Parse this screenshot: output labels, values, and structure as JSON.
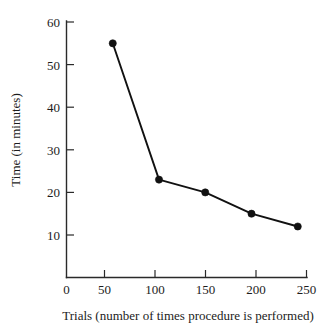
{
  "chart_data": {
    "type": "line",
    "title": "",
    "xlabel": "Trials (number of times procedure is performed)",
    "ylabel": "Time (in minutes)",
    "x": [
      50,
      100,
      150,
      200,
      250
    ],
    "values": [
      55,
      23,
      20,
      15,
      12
    ],
    "series": [
      {
        "name": "",
        "values": [
          55,
          23,
          20,
          15,
          12
        ]
      }
    ],
    "xlim": [
      0,
      260
    ],
    "ylim": [
      0,
      60
    ],
    "xticks": [
      0,
      50,
      100,
      150,
      200,
      250
    ],
    "xtick_labels": [
      "0",
      "50",
      "100",
      "150",
      "200",
      "250"
    ],
    "yticks": [
      10,
      20,
      30,
      40,
      50,
      60
    ],
    "ytick_labels": [
      "10",
      "20",
      "30",
      "40",
      "50",
      "60"
    ],
    "grid": false,
    "legend": false,
    "legend_position": "none",
    "marker": "filled-circle",
    "line_color": "#111111",
    "marker_color": "#111111",
    "axis_color": "#2a2a2a",
    "background": "#ffffff"
  }
}
